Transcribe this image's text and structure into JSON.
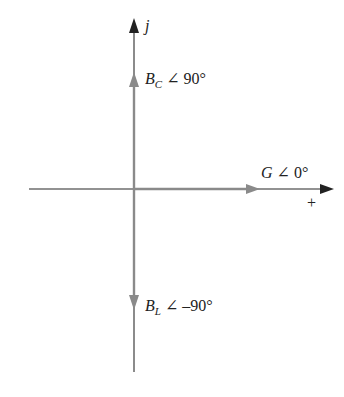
{
  "diagram": {
    "axes": {
      "imag_label": "j",
      "real_sign": "+"
    },
    "phasors": [
      {
        "symbol": "B",
        "subscript": "C",
        "angle": "∠ 90°",
        "direction": "up"
      },
      {
        "symbol": "G",
        "subscript": "",
        "angle": "∠ 0°",
        "direction": "right"
      },
      {
        "symbol": "B",
        "subscript": "L",
        "angle": "∠ –90°",
        "direction": "down"
      }
    ],
    "colors": {
      "axis": "#6e6e6e",
      "phasor": "#8a8a8a",
      "axis_arrow": "#222222",
      "text": "#222222"
    }
  }
}
